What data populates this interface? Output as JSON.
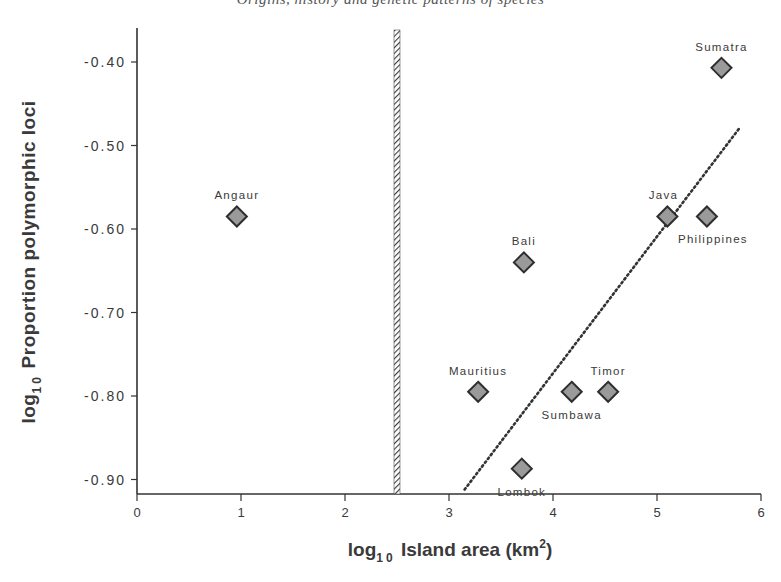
{
  "page": {
    "running_header": "Origins, history and genetic patterns of species"
  },
  "chart_data": {
    "type": "scatter",
    "title": "",
    "xlabel": "log10 Island area (km2)",
    "ylabel": "log10 Proportion polymorphic loci",
    "xlabel_parts": {
      "pre": "log",
      "sub": "10",
      "mid": " Island area (km",
      "sup": "2",
      "post": ")"
    },
    "ylabel_parts": {
      "pre": "log",
      "sub": "10",
      "post": " Proportion  polymorphic  loci"
    },
    "xlim": [
      0,
      6
    ],
    "ylim": [
      -0.92,
      -0.36
    ],
    "x_ticks": [
      0,
      1,
      2,
      3,
      4,
      5,
      6
    ],
    "x_tick_labels": [
      "0",
      "1",
      "2",
      "3",
      "4",
      "5",
      "6"
    ],
    "y_ticks": [
      -0.4,
      -0.5,
      -0.6,
      -0.7,
      -0.8,
      -0.9
    ],
    "y_tick_labels": [
      "-0.40",
      "-0.50",
      "-0.60",
      "-0.70",
      "-0.80",
      "-0.90"
    ],
    "grid": false,
    "legend": null,
    "marker": {
      "shape": "diamond",
      "fill": "#9a9a9a",
      "stroke": "#2e2e2e"
    },
    "points": [
      {
        "label": "Angaur",
        "x": 0.96,
        "y": -0.585,
        "label_pos": "above"
      },
      {
        "label": "Bali",
        "x": 3.72,
        "y": -0.64,
        "label_pos": "above"
      },
      {
        "label": "Sumatra",
        "x": 5.62,
        "y": -0.407,
        "label_pos": "above"
      },
      {
        "label": "Java",
        "x": 5.1,
        "y": -0.585,
        "label_pos": "above"
      },
      {
        "label": "Philippines",
        "x": 5.48,
        "y": -0.585,
        "label_pos": "below"
      },
      {
        "label": "Mauritius",
        "x": 3.28,
        "y": -0.795,
        "label_pos": "above"
      },
      {
        "label": "Sumbawa",
        "x": 4.18,
        "y": -0.795,
        "label_pos": "below"
      },
      {
        "label": "Timor",
        "x": 4.53,
        "y": -0.795,
        "label_pos": "above"
      },
      {
        "label": "Lombok",
        "x": 3.7,
        "y": -0.887,
        "label_pos": "below"
      }
    ],
    "annotations": [
      {
        "type": "dotted_regression_line",
        "x1": 3.15,
        "y1": -0.912,
        "x2": 5.8,
        "y2": -0.478
      },
      {
        "type": "hatched_vertical_bar",
        "x": 2.5,
        "y_top": -0.36
      }
    ]
  }
}
